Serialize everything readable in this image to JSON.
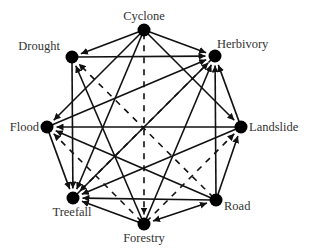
{
  "diagram": {
    "type": "directed-network",
    "nodes": [
      {
        "id": "cyclone",
        "label": "Cyclone",
        "x": 144,
        "y": 30,
        "lx": 144,
        "ly": 20,
        "anchor": "middle"
      },
      {
        "id": "drought",
        "label": "Drought",
        "x": 72,
        "y": 57,
        "lx": 60,
        "ly": 50,
        "anchor": "end"
      },
      {
        "id": "herbivory",
        "label": "Herbivory",
        "x": 215,
        "y": 56,
        "lx": 217,
        "ly": 48,
        "anchor": "start"
      },
      {
        "id": "flood",
        "label": "Flood",
        "x": 47,
        "y": 127,
        "lx": 39,
        "ly": 131,
        "anchor": "end"
      },
      {
        "id": "landslide",
        "label": "Landslide",
        "x": 241,
        "y": 127,
        "lx": 249,
        "ly": 131,
        "anchor": "start"
      },
      {
        "id": "treefall",
        "label": "Treefall",
        "x": 73,
        "y": 198,
        "lx": 72,
        "ly": 216,
        "anchor": "middle"
      },
      {
        "id": "road",
        "label": "Road",
        "x": 216,
        "y": 200,
        "lx": 224,
        "ly": 210,
        "anchor": "start"
      },
      {
        "id": "forestry",
        "label": "Forestry",
        "x": 144,
        "y": 224,
        "lx": 144,
        "ly": 242,
        "anchor": "middle"
      }
    ],
    "edges": [
      {
        "from": "cyclone",
        "to": "drought",
        "style": "solid"
      },
      {
        "from": "cyclone",
        "to": "herbivory",
        "style": "solid"
      },
      {
        "from": "cyclone",
        "to": "flood",
        "style": "solid"
      },
      {
        "from": "cyclone",
        "to": "landslide",
        "style": "solid"
      },
      {
        "from": "cyclone",
        "to": "treefall",
        "style": "solid"
      },
      {
        "from": "cyclone",
        "to": "forestry",
        "style": "dashed"
      },
      {
        "from": "drought",
        "to": "herbivory",
        "style": "solid"
      },
      {
        "from": "drought",
        "to": "treefall",
        "style": "solid"
      },
      {
        "from": "road",
        "to": "drought",
        "style": "dashed"
      },
      {
        "from": "forestry",
        "to": "drought",
        "style": "solid"
      },
      {
        "from": "flood",
        "to": "herbivory",
        "style": "solid"
      },
      {
        "from": "treefall",
        "to": "herbivory",
        "style": "solid"
      },
      {
        "from": "forestry",
        "to": "herbivory",
        "style": "solid"
      },
      {
        "from": "road",
        "to": "herbivory",
        "style": "solid"
      },
      {
        "from": "landslide",
        "to": "herbivory",
        "style": "solid"
      },
      {
        "from": "landslide",
        "to": "flood",
        "style": "solid"
      },
      {
        "from": "road",
        "to": "flood",
        "style": "solid"
      },
      {
        "from": "forestry",
        "to": "flood",
        "style": "dashed"
      },
      {
        "from": "flood",
        "to": "treefall",
        "style": "solid"
      },
      {
        "from": "landslide",
        "to": "treefall",
        "style": "solid"
      },
      {
        "from": "road",
        "to": "landslide",
        "style": "solid"
      },
      {
        "from": "forestry",
        "to": "landslide",
        "style": "dashed"
      },
      {
        "from": "road",
        "to": "treefall",
        "style": "solid"
      },
      {
        "from": "forestry",
        "to": "treefall",
        "style": "solid"
      },
      {
        "from": "herbivory",
        "to": "treefall",
        "style": "dashed"
      },
      {
        "from": "road",
        "to": "forestry",
        "style": "solid",
        "bidirectional": true
      }
    ]
  }
}
